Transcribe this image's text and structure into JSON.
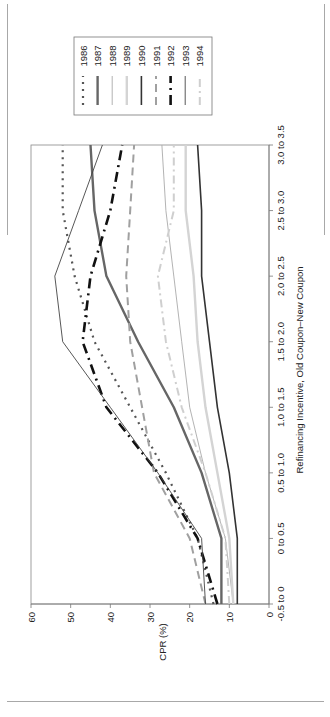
{
  "chart_data": {
    "type": "line",
    "orientation": "rotated-90-ccw",
    "title": "",
    "xlabel": "Refinancing Incentive, Old Coupon–New Coupon",
    "ylabel": "CPR (%)",
    "ylim": [
      0,
      60
    ],
    "yticks": [
      "0",
      "10",
      "20",
      "30",
      "40",
      "50",
      "60"
    ],
    "grid": false,
    "legend_position": "right",
    "categories": [
      "-0.5 to 0",
      "0 to 0.5",
      "0.5 to 1.0",
      "1.0 to 1.5",
      "1.5 to 2.0",
      "2.0 to 2.5",
      "2.5 to 3.0",
      "3.0 to 3.5"
    ],
    "series": [
      {
        "name": "1986",
        "color": "#555555",
        "style": "dotted",
        "values": [
          14,
          18,
          26,
          35,
          44,
          49,
          52,
          52
        ]
      },
      {
        "name": "1987",
        "color": "#666666",
        "style": "solid-thick",
        "values": [
          12,
          12,
          17,
          24,
          33,
          41,
          44,
          45
        ]
      },
      {
        "name": "1988",
        "color": "#aaaaaa",
        "style": "solid-thin",
        "values": [
          9,
          11,
          16,
          20,
          22,
          24,
          26,
          27
        ]
      },
      {
        "name": "1989",
        "color": "#d4d4d4",
        "style": "solid-thick",
        "values": [
          9,
          10,
          13,
          16,
          18,
          19,
          21,
          21
        ]
      },
      {
        "name": "1990",
        "color": "#333333",
        "style": "solid",
        "values": [
          8,
          8,
          10,
          13,
          15,
          17,
          17,
          18
        ]
      },
      {
        "name": "1991",
        "color": "#a0a0a0",
        "style": "dashed",
        "values": [
          16,
          20,
          29,
          32,
          35,
          36,
          35,
          34
        ]
      },
      {
        "name": "1992",
        "color": "#111111",
        "style": "dash-dot-thick",
        "values": [
          13,
          18,
          28,
          41,
          47,
          45,
          40,
          37
        ]
      },
      {
        "name": "1993",
        "color": "#444444",
        "style": "solid-thin",
        "values": [
          16,
          17,
          28,
          40,
          52,
          54,
          48,
          42
        ]
      },
      {
        "name": "1994",
        "color": "#cfcfcf",
        "style": "dash-dot",
        "values": [
          10,
          11,
          16,
          22,
          26,
          28,
          24,
          24
        ]
      }
    ]
  }
}
